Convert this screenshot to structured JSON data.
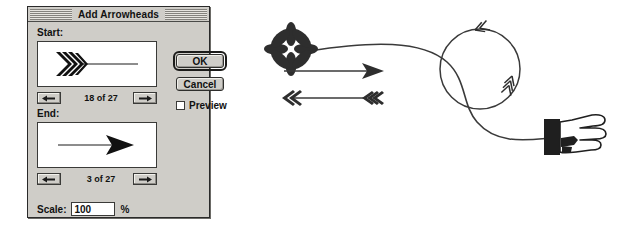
{
  "dialog": {
    "title": "Add Arrowheads",
    "start": {
      "label": "Start:",
      "counter": "18 of 27",
      "prev_icon": "left-arrow-icon",
      "next_icon": "right-arrow-icon",
      "preview_icon": "feathered-chevron-arrowhead"
    },
    "end": {
      "label": "End:",
      "counter": "3 of 27",
      "prev_icon": "left-arrow-icon",
      "next_icon": "right-arrow-icon",
      "preview_icon": "solid-triangle-arrowhead"
    },
    "buttons": {
      "ok": "OK",
      "cancel": "Cancel"
    },
    "preview": {
      "label": "Preview",
      "checked": false
    },
    "scale": {
      "label": "Scale:",
      "value": "100",
      "unit": "%"
    },
    "colors": {
      "face": "#cfcdc8",
      "border": "#2a2a2a",
      "field": "#ffffff",
      "text": "#111111"
    }
  },
  "artwork": {
    "description": "Illustration of arrowhead styles applied to paths",
    "ink_color": "#3a3a3a",
    "items": [
      {
        "name": "flower-arrowhead-curve",
        "arrowhead_start": "flower-8-petal",
        "arrowhead_end": "pointing-hand"
      },
      {
        "name": "solid-triangle-arrow",
        "arrowhead_start": "none",
        "arrowhead_end": "solid-concave-triangle"
      },
      {
        "name": "chevron-arrow",
        "arrowhead_start": "double-chevron-left",
        "arrowhead_end": "triple-chevron-left"
      },
      {
        "name": "circle-loop",
        "arrowhead_start": "feather-chevron",
        "arrowhead_end": "feather-chevron"
      }
    ]
  }
}
